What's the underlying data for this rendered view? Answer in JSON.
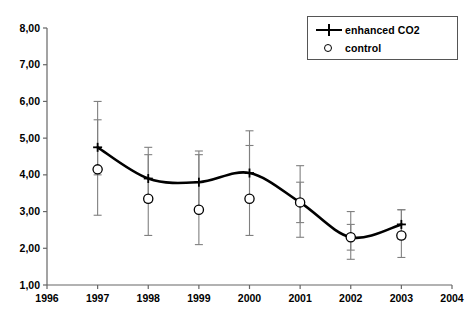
{
  "chart_data": {
    "type": "line",
    "title": "",
    "subtitle": "",
    "xlabel": "",
    "ylabel": "",
    "xlim": [
      1996,
      2004
    ],
    "ylim": [
      1.0,
      8.0
    ],
    "grid": false,
    "legend_position": "top-right",
    "x": [
      1997,
      1998,
      1999,
      2000,
      2001,
      2002,
      2003
    ],
    "xtick_labels": [
      "1996",
      "1997",
      "1998",
      "1999",
      "2000",
      "2001",
      "2002",
      "2003",
      "2004"
    ],
    "xticks": [
      1996,
      1997,
      1998,
      1999,
      2000,
      2001,
      2002,
      2003,
      2004
    ],
    "ytick_labels": [
      "1,00",
      "2,00",
      "3,00",
      "4,00",
      "5,00",
      "6,00",
      "7,00",
      "8,00"
    ],
    "yticks": [
      1.0,
      2.0,
      3.0,
      4.0,
      5.0,
      6.0,
      7.0,
      8.0
    ],
    "decimal_separator": ",",
    "series": [
      {
        "name": "enhanced CO2",
        "marker": "cross",
        "line_style": "smooth-solid",
        "color": "#000000",
        "values": [
          4.75,
          3.9,
          3.8,
          4.05,
          3.25,
          2.3,
          2.65
        ],
        "error_low": [
          4.0,
          3.25,
          3.05,
          3.3,
          2.7,
          1.95,
          2.25
        ],
        "error_high": [
          5.5,
          4.55,
          4.55,
          4.8,
          3.8,
          2.65,
          3.05
        ]
      },
      {
        "name": "control",
        "marker": "open-circle",
        "line_style": "none",
        "color": "#000000",
        "values": [
          4.15,
          3.35,
          3.05,
          3.35,
          3.25,
          2.3,
          2.35
        ],
        "error_low": [
          2.9,
          2.35,
          2.1,
          2.35,
          2.3,
          1.7,
          1.75
        ],
        "error_high": [
          6.0,
          4.75,
          4.65,
          5.2,
          4.25,
          3.0,
          3.05
        ]
      }
    ]
  },
  "legend": {
    "items": [
      {
        "label": "enhanced CO2",
        "marker": "line-cross"
      },
      {
        "label": "control",
        "marker": "open-circle"
      }
    ]
  },
  "colors": {
    "line": "#000000",
    "error_bar": "#808080",
    "axis": "#666666",
    "legend_border": "#555555",
    "background": "#ffffff"
  }
}
